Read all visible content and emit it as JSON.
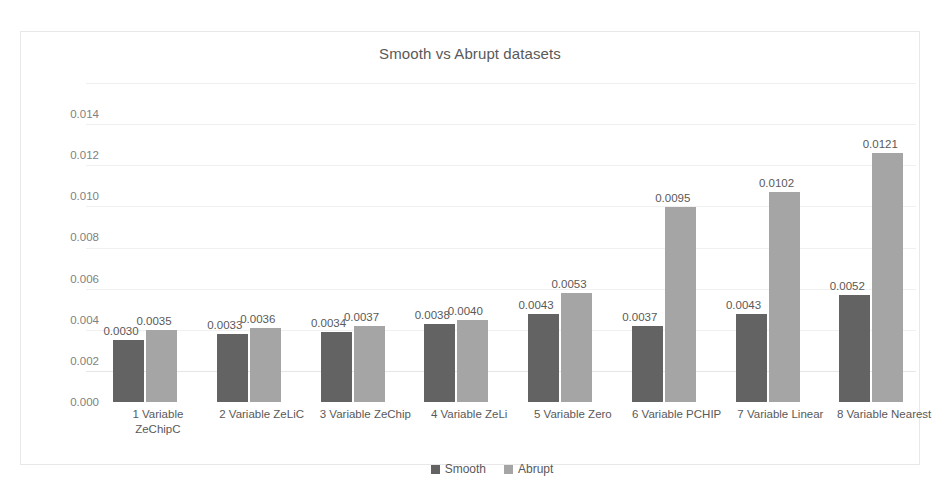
{
  "chart_data": {
    "type": "bar",
    "title": "Smooth vs Abrupt datasets",
    "xlabel": "",
    "ylabel": "",
    "ylim": [
      0.0,
      0.014
    ],
    "ytick_labels": [
      "0.014",
      "0.012",
      "0.010",
      "0.008",
      "0.006",
      "0.004",
      "0.002",
      "0.000"
    ],
    "ytick_values": [
      0.014,
      0.012,
      0.01,
      0.008,
      0.006,
      0.004,
      0.002,
      0.0
    ],
    "grid": true,
    "legend_position": "bottom",
    "categories": [
      "1 Variable ZeChipC",
      "2 Variable ZeLiC",
      "3 Variable ZeChip",
      "4 Variable ZeLi",
      "5 Variable Zero",
      "6 Variable PCHIP",
      "7 Variable Linear",
      "8 Variable Nearest"
    ],
    "category_lines": [
      [
        "1 Variable",
        "ZeChipC"
      ],
      [
        "2 Variable ZeLiC"
      ],
      [
        "3 Variable ZeChip"
      ],
      [
        "4 Variable ZeLi"
      ],
      [
        "5 Variable Zero"
      ],
      [
        "6 Variable PCHIP"
      ],
      [
        "7 Variable Linear"
      ],
      [
        "8 Variable Nearest"
      ]
    ],
    "series": [
      {
        "name": "Smooth",
        "color": "#636363",
        "values": [
          0.003,
          0.0033,
          0.0034,
          0.0038,
          0.0043,
          0.0037,
          0.0043,
          0.0052
        ],
        "labels": [
          "0.0030",
          "0.0033",
          "0.0034",
          "0.0038",
          "0.0043",
          "0.0037",
          "0.0043",
          "0.0052"
        ]
      },
      {
        "name": "Abrupt",
        "color": "#a5a5a5",
        "values": [
          0.0035,
          0.0036,
          0.0037,
          0.004,
          0.0053,
          0.0095,
          0.0102,
          0.0121
        ],
        "labels": [
          "0.0035",
          "0.0036",
          "0.0037",
          "0.0040",
          "0.0053",
          "0.0095",
          "0.0102",
          "0.0121"
        ]
      }
    ]
  },
  "legend": {
    "items": [
      {
        "label": "Smooth"
      },
      {
        "label": "Abrupt"
      }
    ]
  }
}
